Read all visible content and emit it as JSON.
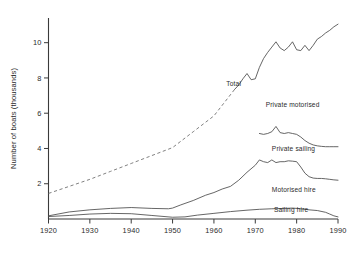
{
  "chart_data": {
    "type": "line",
    "title": "",
    "xlabel": "",
    "ylabel": "Number of boats (thousands)",
    "xlim": [
      1920,
      1990
    ],
    "ylim": [
      0,
      11.4
    ],
    "grid": false,
    "legend_position": "inline-labels",
    "x_ticks": [
      "1920",
      "1930",
      "1940",
      "1950",
      "1960",
      "1970",
      "1980",
      "1990"
    ],
    "x_tick_values": [
      1920,
      1930,
      1940,
      1950,
      1960,
      1970,
      1980,
      1990
    ],
    "y_ticks": [
      "2",
      "4",
      "6",
      "8",
      "10"
    ],
    "y_tick_values": [
      2,
      4,
      6,
      8,
      10
    ],
    "series": [
      {
        "name": "Total",
        "style": "solid-with-dashed-estimate",
        "label": "Total",
        "points": [
          [
            1920,
            1.45
          ],
          [
            1925,
            1.85
          ],
          [
            1930,
            2.25
          ],
          [
            1935,
            2.7
          ],
          [
            1940,
            3.15
          ],
          [
            1945,
            3.6
          ],
          [
            1950,
            4.05
          ],
          [
            1955,
            4.95
          ],
          [
            1960,
            5.85
          ],
          [
            1965,
            7.35
          ]
        ],
        "dashed": true
      },
      {
        "name": "Total",
        "style": "solid",
        "label": "",
        "points": [
          [
            1965,
            7.35
          ],
          [
            1966,
            7.6
          ],
          [
            1967,
            7.95
          ],
          [
            1968,
            8.25
          ],
          [
            1969,
            7.9
          ],
          [
            1970,
            7.95
          ],
          [
            1971,
            8.6
          ],
          [
            1972,
            9.1
          ],
          [
            1973,
            9.45
          ],
          [
            1974,
            9.75
          ],
          [
            1975,
            10.05
          ],
          [
            1976,
            9.7
          ],
          [
            1977,
            9.55
          ],
          [
            1978,
            9.75
          ],
          [
            1979,
            10.05
          ],
          [
            1980,
            9.6
          ],
          [
            1981,
            9.55
          ],
          [
            1982,
            9.85
          ],
          [
            1983,
            9.55
          ],
          [
            1984,
            9.85
          ],
          [
            1985,
            10.2
          ],
          [
            1986,
            10.35
          ],
          [
            1987,
            10.55
          ],
          [
            1988,
            10.7
          ],
          [
            1989,
            10.9
          ],
          [
            1990,
            11.05
          ]
        ],
        "dashed": false
      },
      {
        "name": "Private motorised",
        "style": "solid",
        "label": "Private motorised",
        "points": [
          [
            1971,
            4.85
          ],
          [
            1972,
            4.8
          ],
          [
            1973,
            4.85
          ],
          [
            1974,
            4.95
          ],
          [
            1975,
            5.25
          ],
          [
            1976,
            4.9
          ],
          [
            1977,
            4.85
          ],
          [
            1978,
            4.9
          ],
          [
            1979,
            4.85
          ],
          [
            1980,
            4.8
          ],
          [
            1981,
            4.65
          ],
          [
            1982,
            4.45
          ],
          [
            1983,
            4.3
          ],
          [
            1984,
            4.2
          ],
          [
            1985,
            4.15
          ],
          [
            1986,
            4.12
          ],
          [
            1987,
            4.1
          ],
          [
            1988,
            4.1
          ],
          [
            1989,
            4.1
          ],
          [
            1990,
            4.1
          ]
        ],
        "dashed": false
      },
      {
        "name": "Motorised hire",
        "style": "solid",
        "label": "Motorised hire",
        "points": [
          [
            1920,
            0.18
          ],
          [
            1925,
            0.4
          ],
          [
            1930,
            0.52
          ],
          [
            1935,
            0.6
          ],
          [
            1940,
            0.65
          ],
          [
            1945,
            0.6
          ],
          [
            1949,
            0.58
          ],
          [
            1950,
            0.62
          ],
          [
            1952,
            0.8
          ],
          [
            1955,
            1.05
          ],
          [
            1958,
            1.35
          ],
          [
            1960,
            1.5
          ],
          [
            1962,
            1.7
          ],
          [
            1964,
            1.85
          ],
          [
            1966,
            2.2
          ],
          [
            1968,
            2.65
          ],
          [
            1970,
            3.05
          ],
          [
            1971,
            3.35
          ],
          [
            1972,
            3.25
          ],
          [
            1973,
            3.2
          ],
          [
            1974,
            3.35
          ],
          [
            1975,
            3.2
          ],
          [
            1976,
            3.25
          ],
          [
            1977,
            3.25
          ],
          [
            1978,
            3.3
          ],
          [
            1979,
            3.28
          ],
          [
            1980,
            3.25
          ],
          [
            1981,
            2.95
          ],
          [
            1982,
            2.6
          ],
          [
            1983,
            2.4
          ],
          [
            1984,
            2.32
          ],
          [
            1985,
            2.3
          ],
          [
            1986,
            2.3
          ],
          [
            1987,
            2.28
          ],
          [
            1988,
            2.25
          ],
          [
            1989,
            2.22
          ],
          [
            1990,
            2.2
          ]
        ],
        "dashed": false
      },
      {
        "name": "Sailing hire",
        "style": "solid",
        "label": "Sailing hire",
        "points": [
          [
            1920,
            0.14
          ],
          [
            1925,
            0.2
          ],
          [
            1930,
            0.28
          ],
          [
            1935,
            0.32
          ],
          [
            1940,
            0.3
          ],
          [
            1945,
            0.2
          ],
          [
            1950,
            0.1
          ],
          [
            1953,
            0.12
          ],
          [
            1956,
            0.22
          ],
          [
            1960,
            0.32
          ],
          [
            1964,
            0.42
          ],
          [
            1968,
            0.5
          ],
          [
            1971,
            0.55
          ],
          [
            1974,
            0.58
          ],
          [
            1977,
            0.6
          ],
          [
            1979,
            0.62
          ],
          [
            1981,
            0.58
          ],
          [
            1983,
            0.52
          ],
          [
            1985,
            0.48
          ],
          [
            1987,
            0.38
          ],
          [
            1988,
            0.28
          ],
          [
            1989,
            0.18
          ],
          [
            1990,
            0.12
          ]
        ],
        "dashed": false
      },
      {
        "name": "Private sailing",
        "style": "label-only",
        "label": "Private sailing",
        "points": [],
        "dashed": false
      }
    ],
    "annotations": [
      {
        "text": "Total",
        "x": 1963.0,
        "y": 7.55
      },
      {
        "text": "Private motorised",
        "x": 1972.5,
        "y": 6.35
      },
      {
        "text": "Private sailing",
        "x": 1974.0,
        "y": 3.85
      },
      {
        "text": "Motorised hire",
        "x": 1974.0,
        "y": 1.55
      },
      {
        "text": "Sailing hire",
        "x": 1974.5,
        "y": 0.42
      }
    ]
  }
}
